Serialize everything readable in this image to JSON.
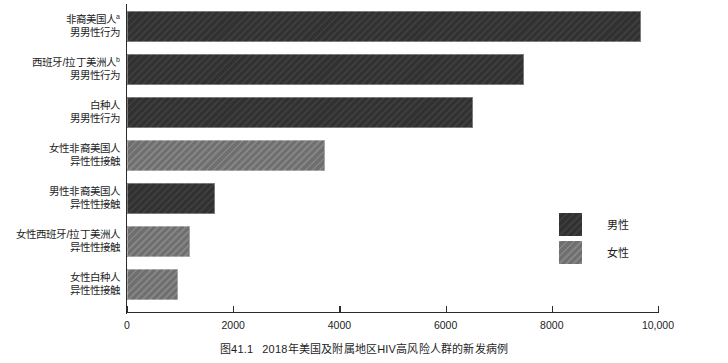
{
  "chart_data": {
    "type": "bar",
    "orientation": "horizontal",
    "title": "",
    "xlabel": "",
    "ylabel": "",
    "xlim": [
      0,
      10000
    ],
    "grid": false,
    "categories": [
      "非裔美国人ᵃ 男男性行为",
      "西班牙/拉丁美洲人ᵇ 男男性行为",
      "白种人 男男性行为",
      "女性非裔美国人 异性性接触",
      "男性非裔美国人 异性性接触",
      "女性西班牙/拉丁美洲人 异性性接触",
      "女性白种人 异性性接触"
    ],
    "values": [
      9680,
      7480,
      6520,
      3730,
      1650,
      1190,
      960
    ],
    "series": [
      {
        "name": "男性",
        "color": "#343434"
      },
      {
        "name": "女性",
        "color": "#767676"
      }
    ],
    "bars": [
      {
        "line1": "非裔美国人",
        "sup": "a",
        "line2": "男男性行为",
        "value": 9680,
        "group": "male"
      },
      {
        "line1": "西班牙/拉丁美洲人",
        "sup": "b",
        "line2": "男男性行为",
        "value": 7480,
        "group": "male"
      },
      {
        "line1": "白种人",
        "sup": "",
        "line2": "男男性行为",
        "value": 6520,
        "group": "male"
      },
      {
        "line1": "女性非裔美国人",
        "sup": "",
        "line2": "异性性接触",
        "value": 3730,
        "group": "female"
      },
      {
        "line1": "男性非裔美国人",
        "sup": "",
        "line2": "异性性接触",
        "value": 1650,
        "group": "male"
      },
      {
        "line1": "女性西班牙/拉丁美洲人",
        "sup": "",
        "line2": "异性性接触",
        "value": 1190,
        "group": "female"
      },
      {
        "line1": "女性白种人",
        "sup": "",
        "line2": "异性性接触",
        "value": 960,
        "group": "female"
      }
    ],
    "xticks": [
      {
        "value": 0,
        "label": "0"
      },
      {
        "value": 2000,
        "label": "2000"
      },
      {
        "value": 4000,
        "label": "4000"
      },
      {
        "value": 6000,
        "label": "6000"
      },
      {
        "value": 8000,
        "label": "8000"
      },
      {
        "value": 10000,
        "label": "10,000"
      }
    ],
    "legend": {
      "position": "middle-right",
      "entries": [
        {
          "label": "男性",
          "color": "#343434"
        },
        {
          "label": "女性",
          "color": "#767676"
        }
      ]
    }
  },
  "caption": {
    "number": "图41.1",
    "text": "2018年美国及附属地区HIV高风险人群的新发病例"
  },
  "colors": {
    "male": "#343434",
    "female": "#767676",
    "axis": "#2b2b2b",
    "text": "#1d1d1d",
    "background": "#ffffff"
  }
}
